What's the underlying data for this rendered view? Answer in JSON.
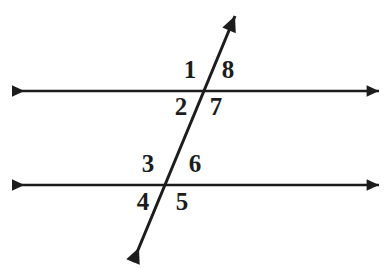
{
  "figure": {
    "kind": "geometry-diagram",
    "background_color": "#ffffff",
    "stroke_color": "#1c1c1c",
    "label_color": "#1c1c1c",
    "width": 391,
    "height": 269
  },
  "lines": {
    "top_parallel": {
      "name": "top-parallel-line",
      "x1": 12,
      "y1": 91,
      "x2": 379,
      "y2": 91,
      "arrow_start": true,
      "arrow_end": true
    },
    "bottom_parallel": {
      "name": "bottom-parallel-line",
      "x1": 12,
      "y1": 185,
      "x2": 379,
      "y2": 185,
      "arrow_start": true,
      "arrow_end": true
    },
    "transversal": {
      "name": "transversal-line",
      "x1": 133,
      "y1": 262,
      "x2": 235,
      "y2": 16,
      "arrow_start": true,
      "arrow_end": true
    }
  },
  "intersections": [
    {
      "name": "upper-intersection",
      "x": 208,
      "y": 91
    },
    {
      "name": "lower-intersection",
      "x": 172,
      "y": 185
    }
  ],
  "angle_labels": [
    {
      "id": "1",
      "text": "1",
      "x": 190,
      "y": 70,
      "position": "upper-intersection-top-left"
    },
    {
      "id": "2",
      "text": "2",
      "x": 181,
      "y": 107,
      "position": "upper-intersection-bottom-left"
    },
    {
      "id": "3",
      "text": "3",
      "x": 148,
      "y": 164,
      "position": "lower-intersection-top-left"
    },
    {
      "id": "4",
      "text": "4",
      "x": 143,
      "y": 202,
      "position": "lower-intersection-bottom-left"
    },
    {
      "id": "5",
      "text": "5",
      "x": 182,
      "y": 202,
      "position": "lower-intersection-bottom-right"
    },
    {
      "id": "6",
      "text": "6",
      "x": 195,
      "y": 164,
      "position": "lower-intersection-top-right"
    },
    {
      "id": "7",
      "text": "7",
      "x": 216,
      "y": 107,
      "position": "upper-intersection-bottom-right"
    },
    {
      "id": "8",
      "text": "8",
      "x": 228,
      "y": 70,
      "position": "upper-intersection-top-right"
    }
  ]
}
